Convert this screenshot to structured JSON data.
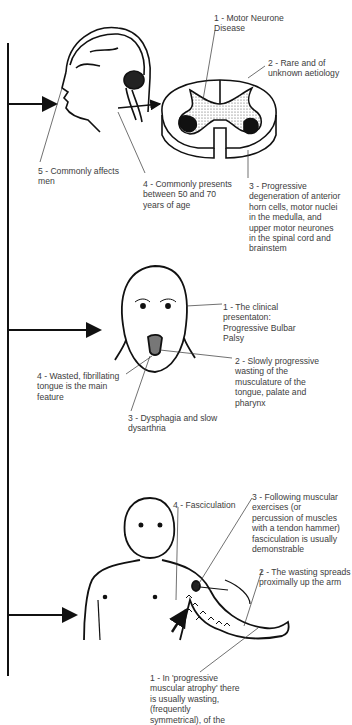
{
  "diagram": {
    "panels": [
      {
        "id": "motor-neurone-disease",
        "labels": [
          {
            "n": "1",
            "text": "1 - Motor Neurone\nDisease"
          },
          {
            "n": "2",
            "text": "2 - Rare and of\nunknown aetiology"
          },
          {
            "n": "3",
            "text": "3 - Progressive\ndegeneration of anterior\nhorn cells, motor nuclei\nin the medulla, and\nupper motor neurones\nin the spinal cord and\nbrainstem"
          },
          {
            "n": "4",
            "text": "4 - Commonly presents\nbetween 50 and 70\nyears of age"
          },
          {
            "n": "5",
            "text": "5 - Commonly affects\nmen"
          }
        ]
      },
      {
        "id": "progressive-bulbar-palsy",
        "labels": [
          {
            "n": "1",
            "text": "1 - The clinical\npresentaton:\nProgressive Bulbar\nPalsy"
          },
          {
            "n": "2",
            "text": "2 - Slowly progressive\nwasting of the\nmusculature of the\ntongue, palate and\npharynx"
          },
          {
            "n": "3",
            "text": "3 - Dysphagia and slow\ndysarthria"
          },
          {
            "n": "4",
            "text": "4 - Wasted, fibrillating\ntongue is the main\nfeature"
          }
        ]
      },
      {
        "id": "progressive-muscular-atrophy",
        "labels": [
          {
            "n": "1",
            "text": "1 - In 'progressive\nmuscular atrophy' there\nis usually wasting,\n(frequently\nsymmetrical), of the"
          },
          {
            "n": "2",
            "text": "2 - The wasting spreads\nproximally up the arm"
          },
          {
            "n": "3",
            "text": "3 - Following muscular\nexercises (or\npercussion of muscles\nwith a tendon hammer)\nfasciculation is usually\ndemonstrable"
          },
          {
            "n": "4",
            "text": "4 - Fasciculation"
          }
        ]
      }
    ],
    "colors": {
      "line": "#111111",
      "text": "#3c3c3c",
      "stipple": "#bdbdbd",
      "lesion": "#111111"
    }
  }
}
